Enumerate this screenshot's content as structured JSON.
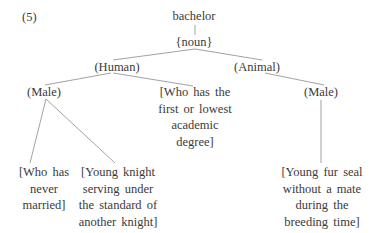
{
  "example_number": "(5)",
  "tree": {
    "root": "bachelor",
    "pos": "{noun}",
    "branches": {
      "human": {
        "label": "(Human)",
        "male": {
          "label": "(Male)",
          "senses": [
            [
              "[Who has",
              "never",
              "married]"
            ],
            [
              "[Young knight",
              "serving under",
              "the standard of",
              "another knight]"
            ]
          ]
        },
        "sense": [
          "[Who has the",
          "first or lowest",
          "academic",
          "degree]"
        ]
      },
      "animal": {
        "label": "(Animal)",
        "male": {
          "label": "(Male)",
          "sense": [
            "[Young fur seal",
            "without a mate",
            "during the",
            "breeding time]"
          ]
        }
      }
    }
  }
}
